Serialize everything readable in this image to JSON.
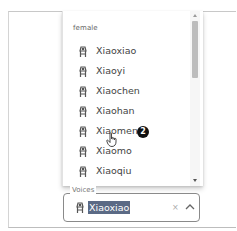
{
  "dropdown": {
    "group_header": "female",
    "options": [
      {
        "label": "Xiaoxiao",
        "icon": "person-icon"
      },
      {
        "label": "Xiaoyi",
        "icon": "person-icon"
      },
      {
        "label": "Xiaochen",
        "icon": "person-icon"
      },
      {
        "label": "Xiaohan",
        "icon": "person-icon"
      },
      {
        "label": "Xiaomeng",
        "icon": "person-icon"
      },
      {
        "label": "Xiaomo",
        "icon": "person-icon"
      },
      {
        "label": "Xiaoqiu",
        "icon": "person-icon"
      }
    ],
    "hovered_option": "Xiaomeng"
  },
  "annotation": {
    "step_badge": "2"
  },
  "select": {
    "label": "Voices",
    "value": "Xiaoxiao",
    "clear_icon": "×",
    "toggle_icon": "chevron-up-icon"
  },
  "colors": {
    "selection_highlight": "#5b6a85",
    "border": "#8a8a8a",
    "scroll_thumb": "#bcbcbc"
  }
}
